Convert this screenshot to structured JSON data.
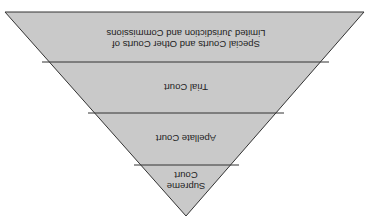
{
  "diagram": {
    "type": "inverted-pyramid",
    "orientation": "rotated-180",
    "fill_color": "#c9c9c9",
    "stroke_color": "#333333",
    "tiers": [
      {
        "label_lines": [
          "Supreme",
          "Court"
        ]
      },
      {
        "label_lines": [
          "Apellate Court"
        ]
      },
      {
        "label_lines": [
          "Trial Court"
        ]
      },
      {
        "label_lines": [
          "Special Courts and Other Courts of",
          "Limited Jurisdiction and Commissions"
        ]
      }
    ]
  }
}
